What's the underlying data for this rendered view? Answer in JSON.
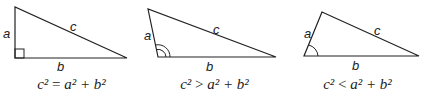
{
  "triangles": [
    {
      "type": "right",
      "labels": {
        "a": "a",
        "b": "b",
        "c": "c"
      },
      "angle_marker": "square",
      "equation": {
        "lhs": "c²",
        "op": "=",
        "rhs": "a² + b²"
      }
    },
    {
      "type": "obtuse",
      "labels": {
        "a": "a",
        "b": "b",
        "c": "c"
      },
      "angle_marker": "double-arc",
      "equation": {
        "lhs": "c²",
        "op": ">",
        "rhs": "a² + b²"
      }
    },
    {
      "type": "acute",
      "labels": {
        "a": "a",
        "b": "b",
        "c": "c"
      },
      "angle_marker": "single-arc",
      "equation": {
        "lhs": "c²",
        "op": "<",
        "rhs": "a² + b²"
      }
    }
  ],
  "colors": {
    "stroke": "#222222",
    "background": "#ffffff"
  }
}
